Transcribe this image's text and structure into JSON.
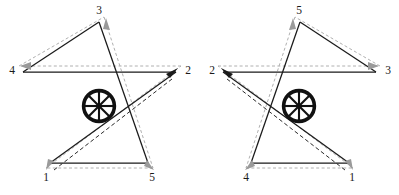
{
  "figure": {
    "panel_count": 2,
    "background_color": "#ffffff",
    "line_color": "#1a1a1a",
    "guide_color": "#b0b0b0",
    "dark_dash_color": "#2b2b2b"
  },
  "geometry": {
    "note": "Shared pentagram outline used by both panels; points listed clockwise from apex",
    "apex": {
      "x": 99,
      "y": 22
    },
    "right": {
      "x": 176,
      "y": 72
    },
    "bottom_right": {
      "x": 148,
      "y": 163
    },
    "bottom_left": {
      "x": 50,
      "y": 163
    },
    "left": {
      "x": 23,
      "y": 72
    },
    "center": {
      "x": 99,
      "y": 106
    }
  },
  "center_icon": {
    "name": "wheel-icon",
    "spokes": 8,
    "outer_radius": 17,
    "rim_color": "#111111",
    "hub_radius": 2.6
  },
  "panels": [
    {
      "id": "left",
      "name": "panel-left",
      "labels": [
        {
          "text": "3",
          "x": 99,
          "y": 11,
          "vertex": "apex"
        },
        {
          "text": "2",
          "x": 188,
          "y": 71,
          "vertex": "right"
        },
        {
          "text": "5",
          "x": 152,
          "y": 178,
          "vertex": "bottom-right"
        },
        {
          "text": "1",
          "x": 46,
          "y": 178,
          "vertex": "bottom-left"
        },
        {
          "text": "4",
          "x": 12,
          "y": 71,
          "vertex": "left"
        }
      ],
      "order": [
        "1",
        "2",
        "3",
        "4",
        "5"
      ],
      "arrows": [
        {
          "name": "arrow-to-2",
          "at": {
            "x": 172,
            "y": 75
          },
          "angle": -31,
          "color": "#1a1a1a"
        },
        {
          "name": "arrow-to-4",
          "at": {
            "x": 30,
            "y": 66
          },
          "angle": 180,
          "color": "#9a9a9a"
        },
        {
          "name": "arrow-to-3",
          "at": {
            "x": 110,
            "y": 30
          },
          "angle": -66,
          "color": "#9a9a9a"
        },
        {
          "name": "arrow-to-1",
          "at": {
            "x": 50,
            "y": 163
          },
          "angle": 112,
          "color": "#9a9a9a"
        },
        {
          "name": "arrow-to-5",
          "at": {
            "x": 143,
            "y": 163
          },
          "angle": 66,
          "color": "#9a9a9a"
        }
      ]
    },
    {
      "id": "right",
      "name": "panel-right",
      "labels": [
        {
          "text": "5",
          "x": 99,
          "y": 11,
          "vertex": "apex"
        },
        {
          "text": "3",
          "x": 188,
          "y": 71,
          "vertex": "right"
        },
        {
          "text": "1",
          "x": 152,
          "y": 178,
          "vertex": "bottom-right"
        },
        {
          "text": "4",
          "x": 46,
          "y": 178,
          "vertex": "bottom-left"
        },
        {
          "text": "2",
          "x": 12,
          "y": 71,
          "vertex": "left"
        }
      ],
      "order": [
        "1",
        "2",
        "3",
        "4",
        "5"
      ],
      "arrows": [
        {
          "name": "arrow-to-2",
          "at": {
            "x": 27,
            "y": 75
          },
          "angle": 211,
          "color": "#1a1a1a"
        },
        {
          "name": "arrow-to-3",
          "at": {
            "x": 169,
            "y": 66
          },
          "angle": 0,
          "color": "#9a9a9a"
        },
        {
          "name": "arrow-to-5",
          "at": {
            "x": 88,
            "y": 30
          },
          "angle": -114,
          "color": "#9a9a9a"
        },
        {
          "name": "arrow-to-1",
          "at": {
            "x": 148,
            "y": 163
          },
          "angle": 68,
          "color": "#9a9a9a"
        },
        {
          "name": "arrow-to-4",
          "at": {
            "x": 56,
            "y": 163
          },
          "angle": 114,
          "color": "#9a9a9a"
        }
      ]
    }
  ]
}
